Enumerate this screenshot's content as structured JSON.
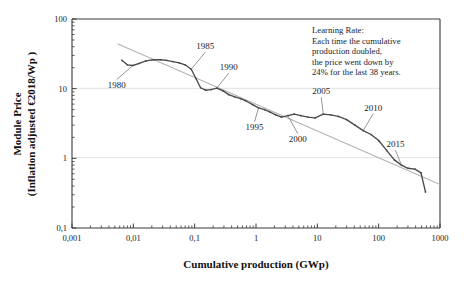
{
  "chart_data": {
    "type": "line",
    "title": "",
    "xlabel": "Cumulative production (GWp)",
    "ylabel_line1": "Module Price",
    "ylabel_line2": "(Inflation adjusted €2018/Wp )",
    "xscale": "log",
    "yscale": "log",
    "xlim": [
      0.001,
      1000
    ],
    "ylim": [
      0.1,
      100
    ],
    "grid": "horizontal-faint-at-decades",
    "legend": "none",
    "x_tick_labels": [
      "0,001",
      "0,01",
      "0,1",
      "1",
      "10",
      "100",
      "1000"
    ],
    "x_tick_values": [
      0.001,
      0.01,
      0.1,
      1,
      10,
      100,
      1000
    ],
    "y_tick_labels": [
      "100",
      "10",
      "1",
      "0,1"
    ],
    "y_tick_values": [
      100,
      10,
      1,
      0.1
    ],
    "series": [
      {
        "name": "Module price experience curve",
        "style": "solid-dark-grey-with-markers",
        "color": "#4a4a4a",
        "x": [
          0.0065,
          0.008,
          0.0098,
          0.0125,
          0.016,
          0.0215,
          0.028,
          0.035,
          0.044,
          0.056,
          0.07,
          0.088,
          0.105,
          0.125,
          0.15,
          0.185,
          0.23,
          0.29,
          0.36,
          0.45,
          0.56,
          0.7,
          0.88,
          1.1,
          1.38,
          1.7,
          2.1,
          2.6,
          3.3,
          4.2,
          5.4,
          7.0,
          9.2,
          12.5,
          16.5,
          22.0,
          30.0,
          41.0,
          56.0,
          75.0,
          100.0,
          135.0,
          180.0,
          235.0,
          300.0,
          390.0,
          490.0,
          580.0
        ],
        "y": [
          25.5,
          22.0,
          21.5,
          23.0,
          25.0,
          26.0,
          26.0,
          25.5,
          24.5,
          23.5,
          22.0,
          19.0,
          14.0,
          10.3,
          9.5,
          9.7,
          10.2,
          9.3,
          8.2,
          7.6,
          7.2,
          6.6,
          5.9,
          5.3,
          5.0,
          4.6,
          4.2,
          3.9,
          4.1,
          4.3,
          4.1,
          3.9,
          3.8,
          4.3,
          4.2,
          4.0,
          3.6,
          3.0,
          2.5,
          2.2,
          1.8,
          1.3,
          0.95,
          0.8,
          0.72,
          0.7,
          0.62,
          0.33
        ]
      },
      {
        "name": "Learning rate trend line",
        "style": "solid-light-grey-straight",
        "color": "#b3b3b3",
        "x": [
          0.0055,
          1000.0
        ],
        "y": [
          44.0,
          0.42
        ]
      }
    ],
    "point_annotations": [
      {
        "label": "1980",
        "x": 0.0098,
        "y": 21.5
      },
      {
        "label": "1985",
        "x": 0.088,
        "y": 19.0
      },
      {
        "label": "1990",
        "x": 0.23,
        "y": 10.2
      },
      {
        "label": "1995",
        "x": 1.1,
        "y": 5.3
      },
      {
        "label": "2000",
        "x": 3.3,
        "y": 4.1
      },
      {
        "label": "2005",
        "x": 12.5,
        "y": 4.3
      },
      {
        "label": "2010",
        "x": 56.0,
        "y": 2.5
      },
      {
        "label": "2015",
        "x": 235.0,
        "y": 0.8
      }
    ],
    "annotation_box": {
      "name": "learning-rate-note",
      "lines": [
        "Learning Rate:",
        "Each time the cumulative",
        "production doubled,",
        "the price went down by",
        "24% for the last 38 years."
      ]
    }
  }
}
